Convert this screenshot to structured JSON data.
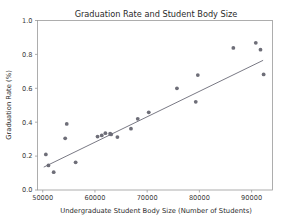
{
  "chart_data": {
    "type": "scatter",
    "title": "Graduation Rate and Student Body Size",
    "xlabel": "Undergraduate Student Body Size (Number of Students)",
    "ylabel": "Graduation Rate (%)",
    "xlim": [
      49000,
      94000
    ],
    "ylim": [
      0.0,
      1.0
    ],
    "xticks": [
      50000,
      60000,
      70000,
      80000,
      90000
    ],
    "xticklabels": [
      "50000",
      "60000",
      "70000",
      "80000",
      "90000"
    ],
    "yticks": [
      0.0,
      0.2,
      0.4,
      0.6,
      0.8,
      1.0
    ],
    "yticklabels": [
      "0.0",
      "0.2",
      "0.4",
      "0.6",
      "0.8",
      "1.0"
    ],
    "grid": false,
    "legend": false,
    "marker_color": "#6e6e78",
    "line_color": "#6a6a76",
    "series": [
      {
        "name": "Universities",
        "marker": "circle",
        "points": [
          {
            "x": 50600,
            "y": 0.21
          },
          {
            "x": 51100,
            "y": 0.145
          },
          {
            "x": 52100,
            "y": 0.105
          },
          {
            "x": 54300,
            "y": 0.305
          },
          {
            "x": 54600,
            "y": 0.39
          },
          {
            "x": 56300,
            "y": 0.163
          },
          {
            "x": 60500,
            "y": 0.315
          },
          {
            "x": 61300,
            "y": 0.322
          },
          {
            "x": 62000,
            "y": 0.335
          },
          {
            "x": 62900,
            "y": 0.332
          },
          {
            "x": 63100,
            "y": 0.328
          },
          {
            "x": 64300,
            "y": 0.312
          },
          {
            "x": 66900,
            "y": 0.362
          },
          {
            "x": 68200,
            "y": 0.42
          },
          {
            "x": 70300,
            "y": 0.458
          },
          {
            "x": 75700,
            "y": 0.6
          },
          {
            "x": 79300,
            "y": 0.52
          },
          {
            "x": 79700,
            "y": 0.678
          },
          {
            "x": 86500,
            "y": 0.838
          },
          {
            "x": 90800,
            "y": 0.868
          },
          {
            "x": 91700,
            "y": 0.828
          },
          {
            "x": 92300,
            "y": 0.682
          }
        ]
      }
    ],
    "trendline": {
      "name": "linear fit",
      "x0": 50200,
      "y0": 0.135,
      "x1": 92200,
      "y1": 0.765
    }
  }
}
